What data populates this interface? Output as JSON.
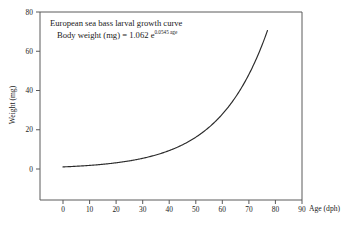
{
  "figure": {
    "background_color": "#ffffff",
    "frame_color": "#5a5a5a",
    "curve_color": "#2b2b2b"
  },
  "annotation": {
    "line1": "European sea bass larval growth curve",
    "line2_prefix": "Body weight (mg) = 1.062 e",
    "line2_exponent": "0.0545 age"
  },
  "axes": {
    "x_title": "Age (dph)",
    "y_title": "Weight (mg)",
    "x_ticks": [
      "0",
      "10",
      "20",
      "30",
      "40",
      "50",
      "60",
      "70",
      "80",
      "90"
    ],
    "y_ticks": [
      "0",
      "20",
      "40",
      "60",
      "80"
    ]
  },
  "chart_data": {
    "type": "line",
    "title": "European sea bass larval growth curve",
    "subtitle": "Body weight (mg) = 1.062 e^(0.0545 age)",
    "xlabel": "Age (dph)",
    "ylabel": "Weight (mg)",
    "xlim": [
      0,
      90
    ],
    "ylim": [
      0,
      80
    ],
    "xticks": [
      0,
      10,
      20,
      30,
      40,
      50,
      60,
      70,
      80,
      90
    ],
    "yticks": [
      0,
      20,
      40,
      60,
      80
    ],
    "grid": false,
    "legend": "none",
    "equation": {
      "coefficient": 1.062,
      "rate": 0.0545,
      "form": "W = 1.062 * exp(0.0545 * age)",
      "variable": "age",
      "units_x": "dph",
      "units_y": "mg"
    },
    "series": [
      {
        "name": "Body weight",
        "x": [
          0,
          5,
          10,
          15,
          20,
          25,
          30,
          35,
          40,
          45,
          50,
          55,
          60,
          65,
          70,
          75,
          77
        ],
        "values": [
          1.06,
          1.4,
          1.83,
          2.4,
          3.16,
          4.15,
          5.45,
          7.16,
          9.41,
          12.37,
          16.25,
          21.36,
          28.07,
          36.89,
          48.48,
          63.71,
          71.05
        ]
      }
    ],
    "curve_x_range": [
      0,
      77
    ],
    "curve_y_range": [
      1.06,
      68
    ]
  }
}
